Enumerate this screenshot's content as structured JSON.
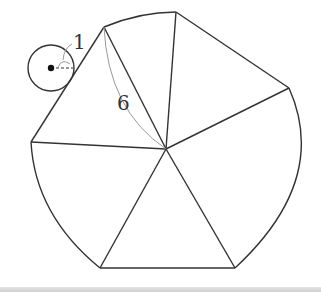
{
  "diagram": {
    "title": "",
    "labels": {
      "small_radius": "1",
      "large_radius": "6"
    },
    "colors": {
      "stroke": "#333333",
      "arc_annotation": "#999999",
      "background": "#ffffff",
      "band": "#d6d6d6"
    },
    "center": {
      "x": 166,
      "y": 149
    },
    "outer_vertices": [
      {
        "x": 104,
        "y": 27
      },
      {
        "x": 176,
        "y": 12
      },
      {
        "x": 289,
        "y": 88
      },
      {
        "x": 235,
        "y": 268
      },
      {
        "x": 100,
        "y": 268
      },
      {
        "x": 31,
        "y": 142
      }
    ],
    "small_circle": {
      "cx": 51,
      "cy": 68,
      "r": 23
    }
  }
}
